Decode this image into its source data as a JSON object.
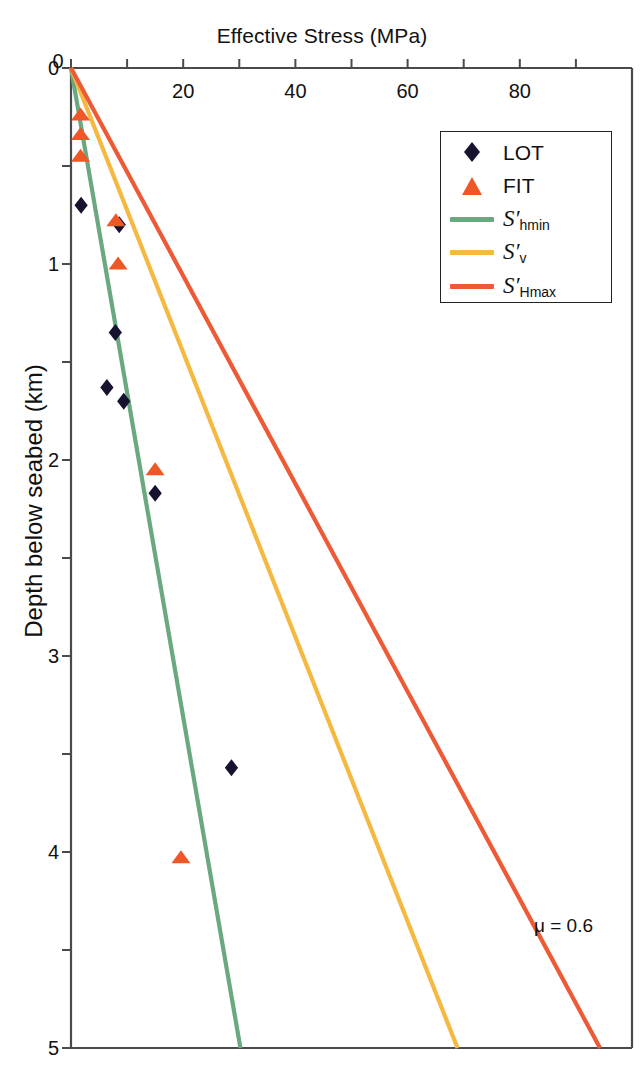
{
  "chart_data": {
    "type": "scatter",
    "title": "Effective Stress (MPa)",
    "xlabel": "Effective Stress (MPa)",
    "ylabel": "Depth below seabed (km)",
    "xlim": [
      0,
      100
    ],
    "ylim": [
      0,
      5
    ],
    "y_axis_inverted": true,
    "x_axis_position": "top",
    "grid": false,
    "xticks_major": [
      0,
      20,
      40,
      60,
      80
    ],
    "xticks_minor": [
      10,
      30,
      50,
      70,
      90
    ],
    "xtick_labels": [
      "0",
      "20",
      "40",
      "60",
      "80"
    ],
    "yticks_major": [
      0,
      1,
      2,
      3,
      4,
      5
    ],
    "ytick_labels": [
      "0",
      "1",
      "2",
      "3",
      "4",
      "5"
    ],
    "yticks_minor": [
      0.5,
      1.5,
      2.5,
      3.5,
      4.5
    ],
    "legend_position": "top-right",
    "annotations": [
      {
        "text": "μ = 0.6",
        "x": 88,
        "y": 4.35
      }
    ],
    "series": [
      {
        "name": "LOT",
        "type": "scatter",
        "marker": "diamond",
        "color": "#151330",
        "points": [
          {
            "x": 1.8,
            "y": 0.7
          },
          {
            "x": 8.6,
            "y": 0.8
          },
          {
            "x": 7.9,
            "y": 1.35
          },
          {
            "x": 6.4,
            "y": 1.63
          },
          {
            "x": 9.4,
            "y": 1.7
          },
          {
            "x": 15.0,
            "y": 2.17
          },
          {
            "x": 28.6,
            "y": 3.57
          }
        ]
      },
      {
        "name": "FIT",
        "type": "scatter",
        "marker": "triangle",
        "color": "#ee5826",
        "points": [
          {
            "x": 1.7,
            "y": 0.24
          },
          {
            "x": 1.7,
            "y": 0.34
          },
          {
            "x": 1.7,
            "y": 0.45
          },
          {
            "x": 8.0,
            "y": 0.78
          },
          {
            "x": 8.4,
            "y": 1.0
          },
          {
            "x": 15.0,
            "y": 2.05
          },
          {
            "x": 19.6,
            "y": 4.03
          }
        ]
      },
      {
        "name": "S'hmin",
        "type": "line",
        "color": "#6aa87f",
        "x": [
          0,
          30.2
        ],
        "y": [
          0,
          5
        ]
      },
      {
        "name": "S'v",
        "type": "line",
        "color": "#f5b942",
        "x": [
          0,
          68.9
        ],
        "y": [
          0,
          5
        ]
      },
      {
        "name": "S'Hmax",
        "type": "line",
        "color": "#ec5b36",
        "x": [
          0,
          94.3
        ],
        "y": [
          0,
          5
        ]
      }
    ]
  },
  "axes": {
    "x_title": "Effective Stress (MPa)",
    "y_title": "Depth below seabed (km)"
  },
  "legend": {
    "entries": [
      {
        "key": "marker-diamond",
        "label": "LOT",
        "sym": "",
        "sub": "",
        "color": "#151330"
      },
      {
        "key": "marker-triangle",
        "label": "FIT",
        "sym": "",
        "sub": "",
        "color": "#ee5826"
      },
      {
        "key": "line",
        "label": "",
        "sym": "S′",
        "sub": "hmin",
        "color": "#6aa87f"
      },
      {
        "key": "line",
        "label": "",
        "sym": "S′",
        "sub": "v",
        "color": "#f5b942"
      },
      {
        "key": "line",
        "label": "",
        "sym": "S′",
        "sub": "Hmax",
        "color": "#ec5b36"
      }
    ]
  },
  "annotation": {
    "friction": "μ = 0.6"
  },
  "colors": {
    "axis": "#4a4a4a",
    "text": "#111111",
    "lot": "#151330",
    "fit": "#ee5826",
    "shmin": "#6aa87f",
    "sv": "#f5b942",
    "shmax": "#ec5b36"
  }
}
